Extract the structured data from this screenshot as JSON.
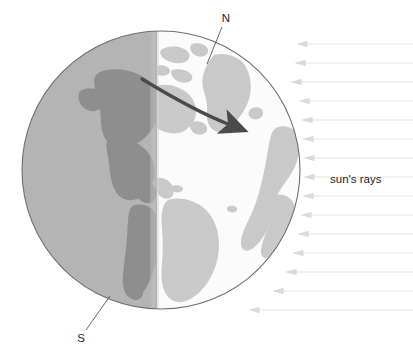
{
  "figure": {
    "type": "earth-day-night-terminator-diagram",
    "width": 413,
    "height": 360,
    "background_color": "#ffffff"
  },
  "labels": {
    "north_pole": "N",
    "south_pole": "S",
    "suns_rays": "sun's rays"
  },
  "globe": {
    "center_x": 161,
    "center_y": 170,
    "radius": 139,
    "outline_color": "#6e6e6e",
    "night": {
      "ocean_color": "#b4b4b4",
      "land_color": "#8e8e8e",
      "side": "left"
    },
    "day": {
      "ocean_color": "#fbfbfb",
      "land_color": "#c9c9c9",
      "side": "right"
    },
    "terminator_x": 156,
    "terminator_color": "#9a9a9a"
  },
  "rotation_arrow": {
    "color": "#4a4a4a",
    "description": "curved arrow showing direction of earth's rotation west to east"
  },
  "suns_rays": {
    "color": "#ededed",
    "arrow_color": "#dcdcdc",
    "direction": "right-to-left",
    "count": 14,
    "y_positions": [
      44,
      63,
      82,
      101,
      120,
      139,
      158,
      177,
      196,
      215,
      234,
      253,
      272,
      291,
      310
    ],
    "x_start": 413,
    "x_end": 300
  },
  "leader_lines": {
    "north": {
      "from_x": 222,
      "from_y": 25,
      "to_x": 207,
      "to_y": 63,
      "color": "#555555"
    },
    "south": {
      "from_x": 85,
      "from_y": 330,
      "to_x": 110,
      "to_y": 296,
      "color": "#555555"
    }
  }
}
